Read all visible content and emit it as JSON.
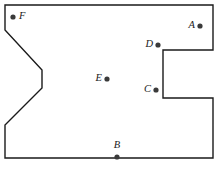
{
  "figure": {
    "canvas": {
      "width": 224,
      "height": 170,
      "background": "#ffffff"
    },
    "style": {
      "outline_color": "#1a1a1a",
      "outline_width": 1.4,
      "dot_color": "#3a3a3a",
      "dot_radius": 2.6,
      "label_color": "#1a1a1a"
    },
    "polygon": {
      "name": "simple-polygon",
      "closed": true,
      "vertices": [
        {
          "x": 5,
          "y": 5
        },
        {
          "x": 213,
          "y": 5
        },
        {
          "x": 213,
          "y": 50
        },
        {
          "x": 163,
          "y": 50
        },
        {
          "x": 163,
          "y": 98
        },
        {
          "x": 213,
          "y": 98
        },
        {
          "x": 213,
          "y": 158
        },
        {
          "x": 5,
          "y": 158
        },
        {
          "x": 5,
          "y": 125
        },
        {
          "x": 42,
          "y": 88
        },
        {
          "x": 42,
          "y": 70
        },
        {
          "x": 5,
          "y": 30
        }
      ],
      "path": "M 5 5 L 213 5 L 213 50 L 163 50 L 163 98 L 213 98 L 213 158 L 5 158 L 5 125 L 42 88 L 42 70 L 5 30 Z"
    },
    "points": [
      {
        "id": "A",
        "label": "A",
        "dot": {
          "x": 200,
          "y": 26
        },
        "label_pos": {
          "x": 195,
          "y": 26
        },
        "label_anchor": "end"
      },
      {
        "id": "B",
        "label": "B",
        "dot": {
          "x": 117,
          "y": 157
        },
        "label_pos": {
          "x": 117,
          "y": 146
        },
        "label_anchor": "middle"
      },
      {
        "id": "C",
        "label": "C",
        "dot": {
          "x": 156,
          "y": 90
        },
        "label_pos": {
          "x": 151,
          "y": 90
        },
        "label_anchor": "end"
      },
      {
        "id": "D",
        "label": "D",
        "dot": {
          "x": 158,
          "y": 45
        },
        "label_pos": {
          "x": 153,
          "y": 45
        },
        "label_anchor": "end"
      },
      {
        "id": "E",
        "label": "E",
        "dot": {
          "x": 107,
          "y": 79
        },
        "label_pos": {
          "x": 102,
          "y": 79
        },
        "label_anchor": "end"
      },
      {
        "id": "F",
        "label": "F",
        "dot": {
          "x": 13,
          "y": 17
        },
        "label_pos": {
          "x": 19,
          "y": 17
        },
        "label_anchor": "start"
      }
    ]
  }
}
